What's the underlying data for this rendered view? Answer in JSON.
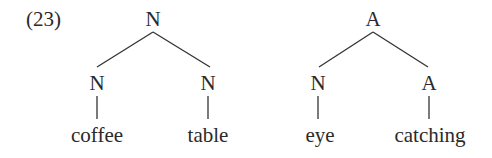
{
  "example": {
    "number_label": "(23)"
  },
  "trees": [
    {
      "root": {
        "label": "N",
        "x": 153
      },
      "children": [
        {
          "label": "N",
          "x": 97,
          "word": "coffee"
        },
        {
          "label": "N",
          "x": 208,
          "word": "table"
        }
      ]
    },
    {
      "root": {
        "label": "A",
        "x": 373
      },
      "children": [
        {
          "label": "N",
          "x": 318,
          "word": "eye"
        },
        {
          "label": "A",
          "x": 429,
          "word": "catching"
        }
      ]
    }
  ],
  "colors": {
    "text": "#2a2a2a",
    "lines": "#333333",
    "background": "#ffffff"
  }
}
